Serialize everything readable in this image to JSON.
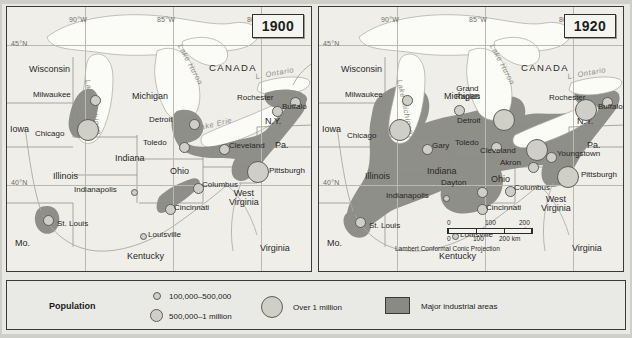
{
  "maps": [
    {
      "id": "map-1900",
      "year": "1900",
      "coords": [
        {
          "label": "90°W",
          "x": 62,
          "y": 9
        },
        {
          "label": "85°W",
          "x": 150,
          "y": 9
        },
        {
          "label": "80°W",
          "x": 240,
          "y": 9
        },
        {
          "label": "45°N",
          "x": 4,
          "y": 33
        },
        {
          "label": "40°N",
          "x": 4,
          "y": 172
        }
      ],
      "country": "CANADA",
      "states": [
        {
          "name": "Wisconsin",
          "x": 22,
          "y": 58
        },
        {
          "name": "Michigan",
          "x": 125,
          "y": 85
        },
        {
          "name": "Iowa",
          "x": 3,
          "y": 118
        },
        {
          "name": "Illinois",
          "x": 46,
          "y": 165
        },
        {
          "name": "Indiana",
          "x": 108,
          "y": 147
        },
        {
          "name": "Ohio",
          "x": 163,
          "y": 160
        },
        {
          "name": "Pa.",
          "x": 268,
          "y": 134
        },
        {
          "name": "N.Y.",
          "x": 258,
          "y": 110
        },
        {
          "name": "Mo.",
          "x": 8,
          "y": 232
        },
        {
          "name": "Kentucky",
          "x": 120,
          "y": 245
        },
        {
          "name": "West\nVirginia",
          "x": 222,
          "y": 182
        },
        {
          "name": "Virginia",
          "x": 253,
          "y": 237
        }
      ],
      "lakes": [
        {
          "name": "Lake Michigan",
          "x": 84,
          "y": 72,
          "rot": 78
        },
        {
          "name": "Lake Huron",
          "x": 176,
          "y": 36,
          "rot": 62
        },
        {
          "name": "Lake Erie",
          "x": 188,
          "y": 118,
          "rot": -13
        },
        {
          "name": "L. Ontario",
          "x": 248,
          "y": 66,
          "rot": -10
        }
      ],
      "cities": [
        {
          "name": "Milwaukee",
          "size": "m",
          "x": 83,
          "y": 88,
          "lx": -57,
          "ly": -4
        },
        {
          "name": "Chicago",
          "size": "l",
          "x": 76,
          "y": 118,
          "lx": -48,
          "ly": 5
        },
        {
          "name": "Detroit",
          "size": "m",
          "x": 182,
          "y": 112,
          "lx": -40,
          "ly": -3
        },
        {
          "name": "Toledo",
          "size": "m",
          "x": 172,
          "y": 135,
          "lx": -36,
          "ly": -3
        },
        {
          "name": "Cleveland",
          "size": "m",
          "x": 212,
          "y": 137,
          "lx": 10,
          "ly": -2
        },
        {
          "name": "Rochester",
          "size": "m",
          "x": 283,
          "y": 90,
          "lx": -53,
          "ly": -3
        },
        {
          "name": "Buffalo",
          "size": "m",
          "x": 265,
          "y": 99,
          "lx": 10,
          "ly": -3
        },
        {
          "name": "Pittsburgh",
          "size": "l",
          "x": 247,
          "y": 160,
          "lx": 20,
          "ly": 3
        },
        {
          "name": "Columbus",
          "size": "m",
          "x": 186,
          "y": 176,
          "lx": 9,
          "ly": -2
        },
        {
          "name": "Indianapolis",
          "size": "s",
          "x": 124,
          "y": 182,
          "lx": -57,
          "ly": -3
        },
        {
          "name": "Cincinnati",
          "size": "m",
          "x": 158,
          "y": 197,
          "lx": 9,
          "ly": 0
        },
        {
          "name": "St. Louis",
          "size": "m",
          "x": 41,
          "y": 210,
          "lx": 9,
          "ly": 3
        },
        {
          "name": "Louisville",
          "size": "s",
          "x": 133,
          "y": 226,
          "lx": 8,
          "ly": -2
        }
      ]
    },
    {
      "id": "map-1920",
      "year": "1920",
      "coords": [
        {
          "label": "90°W",
          "x": 62,
          "y": 9
        },
        {
          "label": "85°W",
          "x": 150,
          "y": 9
        },
        {
          "label": "80°W",
          "x": 240,
          "y": 9
        },
        {
          "label": "45°N",
          "x": 4,
          "y": 33
        },
        {
          "label": "40°N",
          "x": 4,
          "y": 172
        }
      ],
      "country": "CANADA",
      "states": [
        {
          "name": "Wisconsin",
          "x": 22,
          "y": 58
        },
        {
          "name": "Michigan",
          "x": 125,
          "y": 85
        },
        {
          "name": "Iowa",
          "x": 3,
          "y": 118
        },
        {
          "name": "Illinois",
          "x": 46,
          "y": 165
        },
        {
          "name": "Indiana",
          "x": 108,
          "y": 160
        },
        {
          "name": "Ohio",
          "x": 172,
          "y": 168
        },
        {
          "name": "Pa.",
          "x": 268,
          "y": 134
        },
        {
          "name": "N.Y.",
          "x": 258,
          "y": 110
        },
        {
          "name": "Mo.",
          "x": 8,
          "y": 232
        },
        {
          "name": "Kentucky",
          "x": 120,
          "y": 245
        },
        {
          "name": "West\nVirginia",
          "x": 222,
          "y": 188
        },
        {
          "name": "Virginia",
          "x": 253,
          "y": 237
        }
      ],
      "lakes": [
        {
          "name": "Lake Michigan",
          "x": 84,
          "y": 72,
          "rot": 78
        },
        {
          "name": "Lake Huron",
          "x": 176,
          "y": 36,
          "rot": 62
        },
        {
          "name": "Lake Erie",
          "x": 188,
          "y": 118,
          "rot": -13
        },
        {
          "name": "L. Ontario",
          "x": 248,
          "y": 66,
          "rot": -10
        }
      ],
      "cities": [
        {
          "name": "Milwaukee",
          "size": "m",
          "x": 83,
          "y": 88,
          "lx": -57,
          "ly": -4
        },
        {
          "name": "Grand\nRapids",
          "size": "m",
          "x": 135,
          "y": 98,
          "lx": 6,
          "ly": -13
        },
        {
          "name": "Chicago",
          "size": "l",
          "x": 76,
          "y": 118,
          "lx": -48,
          "ly": 7
        },
        {
          "name": "Gary",
          "size": "m",
          "x": 103,
          "y": 137,
          "lx": 10,
          "ly": -2
        },
        {
          "name": "Detroit",
          "size": "l",
          "x": 180,
          "y": 108,
          "lx": -42,
          "ly": 2
        },
        {
          "name": "Toledo",
          "size": "m",
          "x": 172,
          "y": 135,
          "lx": -36,
          "ly": -3
        },
        {
          "name": "Cleveland",
          "size": "l",
          "x": 213,
          "y": 138,
          "lx": -52,
          "ly": 2
        },
        {
          "name": "Akron",
          "size": "m",
          "x": 209,
          "y": 155,
          "lx": -34,
          "ly": -3
        },
        {
          "name": "Youngstown",
          "size": "m",
          "x": 227,
          "y": 145,
          "lx": 10,
          "ly": -2
        },
        {
          "name": "Rochester",
          "size": "m",
          "x": 283,
          "y": 90,
          "lx": -53,
          "ly": -3
        },
        {
          "name": "Buffalo",
          "size": "l",
          "x": 262,
          "y": 97,
          "lx": 18,
          "ly": -1
        },
        {
          "name": "Pittsburgh",
          "size": "l",
          "x": 245,
          "y": 165,
          "lx": 20,
          "ly": 2
        },
        {
          "name": "Columbus",
          "size": "m",
          "x": 186,
          "y": 179,
          "lx": 9,
          "ly": -2
        },
        {
          "name": "Dayton",
          "size": "m",
          "x": 158,
          "y": 180,
          "lx": -38,
          "ly": -5
        },
        {
          "name": "Indianapolis",
          "size": "s",
          "x": 124,
          "y": 188,
          "lx": -57,
          "ly": -3
        },
        {
          "name": "Cincinnati",
          "size": "m",
          "x": 158,
          "y": 197,
          "lx": 9,
          "ly": 0
        },
        {
          "name": "St. Louis",
          "size": "m",
          "x": 41,
          "y": 212,
          "lx": 9,
          "ly": 3
        },
        {
          "name": "Louisville",
          "size": "s",
          "x": 133,
          "y": 226,
          "lx": 8,
          "ly": -2
        }
      ],
      "scale": {
        "miles": [
          "0",
          "100",
          "200 mi."
        ],
        "km": [
          "0",
          "100",
          "200 km"
        ],
        "projection": "Lambert Conformal Conic Projection"
      }
    }
  ],
  "legend": {
    "title": "Population",
    "items": [
      {
        "label": "100,000–500,000",
        "symbol": "small-circle"
      },
      {
        "label": "500,000–1 million",
        "symbol": "medium-circle"
      },
      {
        "label": "Over 1 million",
        "symbol": "large-circle"
      },
      {
        "label": "Major industrial areas",
        "symbol": "gray-swatch"
      }
    ]
  },
  "colors": {
    "industrial": "#8a8a84",
    "land": "#efeee9",
    "water": "#fbfbf8",
    "city_fill": "#cfcfc8",
    "frame": "#3a3a3a"
  }
}
